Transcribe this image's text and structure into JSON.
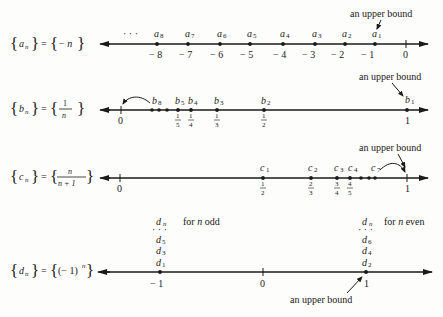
{
  "rows": {
    "a": {
      "seq_name": "a",
      "seq_sub": "n",
      "equals": "=",
      "formula": "− n",
      "ellipsis": "· · ·",
      "points": [
        {
          "label": "a",
          "sub": "8",
          "value": "− 8"
        },
        {
          "label": "a",
          "sub": "7",
          "value": "− 7"
        },
        {
          "label": "a",
          "sub": "6",
          "value": "− 6"
        },
        {
          "label": "a",
          "sub": "5",
          "value": "− 5"
        },
        {
          "label": "a",
          "sub": "4",
          "value": "− 4"
        },
        {
          "label": "a",
          "sub": "3",
          "value": "− 3"
        },
        {
          "label": "a",
          "sub": "2",
          "value": "− 2"
        },
        {
          "label": "a",
          "sub": "1",
          "value": "− 1"
        }
      ],
      "zero": "0",
      "annotation": "an upper bound"
    },
    "b": {
      "seq_name": "b",
      "seq_sub": "n",
      "equals": "=",
      "formula_num": "1",
      "formula_den": "n",
      "points": [
        {
          "label": "b",
          "sub": "5",
          "num": "1",
          "den": "5"
        },
        {
          "label": "b",
          "sub": "4",
          "num": "1",
          "den": "4"
        },
        {
          "label": "b",
          "sub": "3",
          "num": "1",
          "den": "3"
        },
        {
          "label": "b",
          "sub": "2",
          "num": "1",
          "den": "2"
        },
        {
          "label": "b",
          "sub": "1",
          "value": "1"
        }
      ],
      "cluster_label": {
        "label": "b",
        "sub": "8"
      },
      "zero": "0",
      "annotation": "an upper bound"
    },
    "c": {
      "seq_name": "c",
      "seq_sub": "n",
      "equals": "=",
      "formula_num": "n",
      "formula_den": "n + 1",
      "points": [
        {
          "label": "c",
          "sub": "1",
          "num": "1",
          "den": "2"
        },
        {
          "label": "c",
          "sub": "2",
          "num": "2",
          "den": "3"
        },
        {
          "label": "c",
          "sub": "3",
          "num": "3",
          "den": "4"
        },
        {
          "label": "c",
          "sub": "4",
          "num": "4",
          "den": "5"
        }
      ],
      "cluster_label": {
        "label": "c",
        "sub": "7"
      },
      "zero": "0",
      "one": "1",
      "annotation": "an upper bound"
    },
    "d": {
      "seq_name": "d",
      "seq_sub": "n",
      "equals": "=",
      "formula": "(− 1)",
      "formula_exp": "n",
      "odd_stack": [
        {
          "label": "d",
          "sub": "n"
        },
        {
          "label": "d",
          "sub": "5"
        },
        {
          "label": "d",
          "sub": "3"
        },
        {
          "label": "d",
          "sub": "1"
        }
      ],
      "even_stack": [
        {
          "label": "d",
          "sub": "n"
        },
        {
          "label": "d",
          "sub": "6"
        },
        {
          "label": "d",
          "sub": "4"
        },
        {
          "label": "d",
          "sub": "2"
        }
      ],
      "odd_note_pre": "for ",
      "odd_note_var": "n",
      "odd_note_post": " odd",
      "even_note_pre": "for ",
      "even_note_var": "n",
      "even_note_post": " even",
      "ticks": [
        "− 1",
        "0",
        "1"
      ],
      "annotation": "an upper bound"
    }
  }
}
